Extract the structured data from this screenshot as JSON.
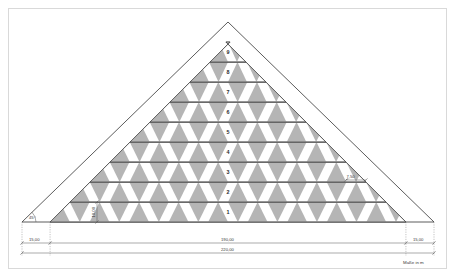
{
  "drawing": {
    "caption": "Maße in m",
    "angle_label": "45°",
    "tier_height_label": "10,00",
    "step_inset_label": "7,50",
    "tier_labels": [
      "1",
      "2",
      "3",
      "4",
      "5",
      "6",
      "7",
      "8",
      "9"
    ],
    "colors": {
      "fill_gray": "#a8a8a8",
      "outline": "#4a4a4a",
      "dimension_line": "#555555",
      "frame": "#d9d9d9",
      "background": "#ffffff"
    }
  },
  "dimensions": {
    "left_offset": "15,00",
    "center_span": "190,00",
    "total_width": "220,00",
    "right_offset": "15,00"
  },
  "chart_data": {
    "type": "diagram",
    "units": "m",
    "total_width": 220,
    "center_span": 190,
    "left_offset": 15,
    "right_offset": 15,
    "tier_count": 9,
    "tier_height": 10,
    "step_inset": 7.5,
    "slope_angle_deg": 45,
    "tiers": [
      {
        "label": "1",
        "index": 1
      },
      {
        "label": "2",
        "index": 2
      },
      {
        "label": "3",
        "index": 3
      },
      {
        "label": "4",
        "index": 4
      },
      {
        "label": "5",
        "index": 5
      },
      {
        "label": "6",
        "index": 6
      },
      {
        "label": "7",
        "index": 7
      },
      {
        "label": "8",
        "index": 8
      },
      {
        "label": "9",
        "index": 9
      }
    ]
  }
}
